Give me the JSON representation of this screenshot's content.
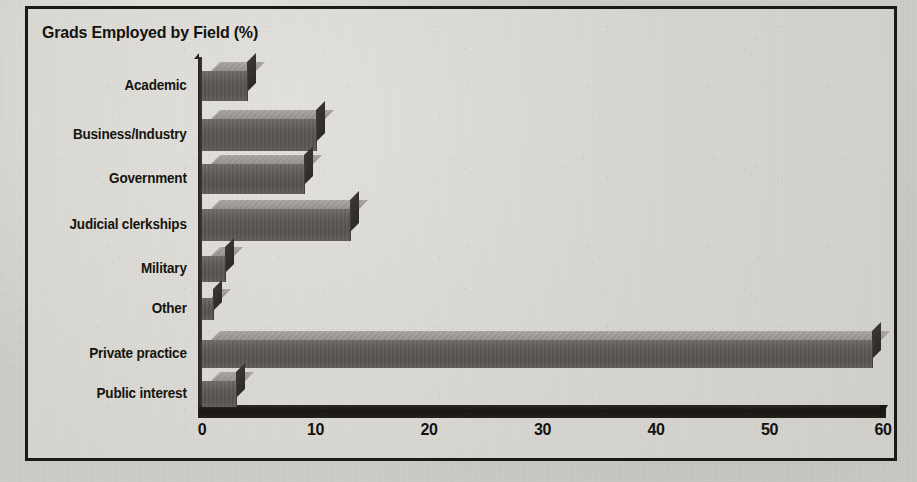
{
  "chart_data": {
    "type": "bar",
    "orientation": "horizontal",
    "style": "3d",
    "title": "Grads Employed by Field (%)",
    "xlabel": "",
    "ylabel": "",
    "xlim": [
      0,
      60
    ],
    "xticks": [
      "0",
      "10",
      "20",
      "30",
      "40",
      "50",
      "60"
    ],
    "grid": false,
    "legend": null,
    "categories": [
      "Academic",
      "Business/Industry",
      "Government",
      "Judicial clerkships",
      "Military",
      "Other",
      "Private practice",
      "Public interest"
    ],
    "values": [
      4,
      10,
      9,
      13,
      2,
      1,
      59,
      3
    ],
    "units": "%",
    "colors": {
      "bar_front": "#5d5954",
      "bar_top": "#a9a6a1",
      "bar_side": "#332f2c",
      "axis": "#191714",
      "background": "#dcdad5",
      "text": "#16140f"
    }
  }
}
